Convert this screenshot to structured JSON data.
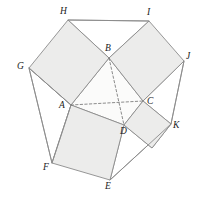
{
  "figure": {
    "canvas": {
      "width": 203,
      "height": 199
    },
    "colors": {
      "background": "#ffffff",
      "square_fill": "#ececeb",
      "hull_fill": "#ffffff",
      "stroke": "#8b8b8b",
      "dashed_stroke": "#6f6f6f",
      "label_color": "#1b1b1b"
    }
  },
  "vertices": {
    "A": {
      "label": "A",
      "x": 71,
      "y": 105,
      "label_x": 59,
      "label_y": 101
    },
    "B": {
      "label": "B",
      "x": 109,
      "y": 58,
      "label_x": 105,
      "label_y": 44
    },
    "C": {
      "label": "C",
      "x": 143,
      "y": 101,
      "label_x": 147,
      "label_y": 97
    },
    "D": {
      "label": "D",
      "x": 124,
      "y": 125,
      "label_x": 120,
      "label_y": 127
    },
    "E": {
      "label": "E",
      "x": 110,
      "y": 180,
      "label_x": 105,
      "label_y": 182
    },
    "F": {
      "label": "F",
      "x": 52,
      "y": 163,
      "label_x": 43,
      "label_y": 163
    },
    "G": {
      "label": "G",
      "x": 29,
      "y": 68,
      "label_x": 17,
      "label_y": 62
    },
    "H": {
      "label": "H",
      "x": 68,
      "y": 20,
      "label_x": 60,
      "label_y": 7
    },
    "I": {
      "label": "I",
      "x": 149,
      "y": 21,
      "label_x": 147,
      "label_y": 8
    },
    "J": {
      "label": "J",
      "x": 184,
      "y": 61,
      "label_x": 186,
      "label_y": 52
    },
    "K": {
      "label": "K",
      "x": 171,
      "y": 124,
      "label_x": 173,
      "label_y": 121
    },
    "L": {
      "label": "",
      "x": 152,
      "y": 148,
      "label_x": 0,
      "label_y": 0
    }
  },
  "faces": {
    "square_AB": {
      "name": "square-on-AB",
      "points": "71,105 29,68 68,20 109,58"
    },
    "square_BC": {
      "name": "square-on-BC",
      "points": "109,58 149,21 184,61 143,101"
    },
    "square_CD": {
      "name": "square-on-CD",
      "points": "143,101 171,124 152,148 124,125"
    },
    "square_DA": {
      "name": "square-on-DA",
      "points": "124,125 110,180 52,163 71,105"
    },
    "core_ABCD": {
      "name": "quadrilateral-ABCD",
      "points": "71,105 109,58 143,101 124,125"
    }
  },
  "hull_edges": {
    "HI": {
      "name": "edge-H-I",
      "points": "68,20 149,21"
    },
    "JK": {
      "name": "edge-J-K",
      "points": "184,61 171,124"
    },
    "KE": {
      "name": "edge-K-E",
      "points": "171,124 110,180"
    },
    "FG": {
      "name": "edge-F-G",
      "points": "52,163 29,68"
    },
    "GA": {
      "name": "edge-G-A",
      "points": "29,68 71,105"
    },
    "AF": {
      "name": "edge-A-F",
      "points": "71,105 52,163"
    }
  },
  "diagonals": {
    "AC": {
      "name": "diagonal-A-C",
      "x1": 71,
      "y1": 105,
      "x2": 143,
      "y2": 101
    },
    "BD": {
      "name": "diagonal-B-D",
      "x1": 109,
      "y1": 58,
      "x2": 124,
      "y2": 125
    }
  },
  "labels_order": [
    "H",
    "I",
    "B",
    "G",
    "J",
    "A",
    "C",
    "K",
    "D",
    "F",
    "E"
  ]
}
